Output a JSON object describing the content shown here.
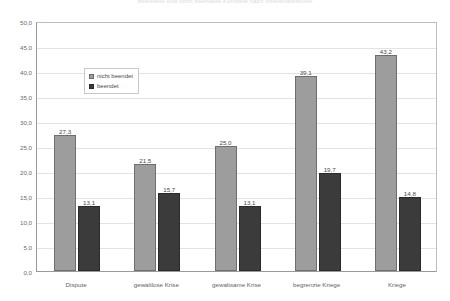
{
  "chart_data": {
    "type": "bar",
    "title": "Beendete und nicht beendete Konflikte nach Intensitätsstufen",
    "subtitle": "",
    "xlabel": "",
    "ylabel": "",
    "categories": [
      "Dispute",
      "gewaltlose Krise",
      "gewaltsame Krise",
      "begrenzte Kriege",
      "Kriege"
    ],
    "series": [
      {
        "name": "nicht beendet",
        "color": "#9d9d9d",
        "values": [
          27.3,
          21.5,
          25.0,
          39.1,
          43.2
        ],
        "labels": [
          "27,3",
          "21,5",
          "25,0",
          "39,1",
          "43,2"
        ]
      },
      {
        "name": "beendet",
        "color": "#3b3b3b",
        "values": [
          13.1,
          15.7,
          13.1,
          19.7,
          14.8
        ],
        "labels": [
          "13,1",
          "15,7",
          "13,1",
          "19,7",
          "14,8"
        ]
      }
    ],
    "ylim": [
      0.0,
      50.0
    ],
    "ytick_values": [
      0.0,
      5.0,
      10.0,
      15.0,
      20.0,
      25.0,
      30.0,
      35.0,
      40.0,
      45.0,
      50.0
    ],
    "ytick_labels": [
      "0,0",
      "5,0",
      "10,0",
      "15,0",
      "20,0",
      "25,0",
      "30,0",
      "35,0",
      "40,0",
      "45,0",
      "50,0"
    ],
    "grid": true,
    "legend_position": "upper-left-inside"
  }
}
